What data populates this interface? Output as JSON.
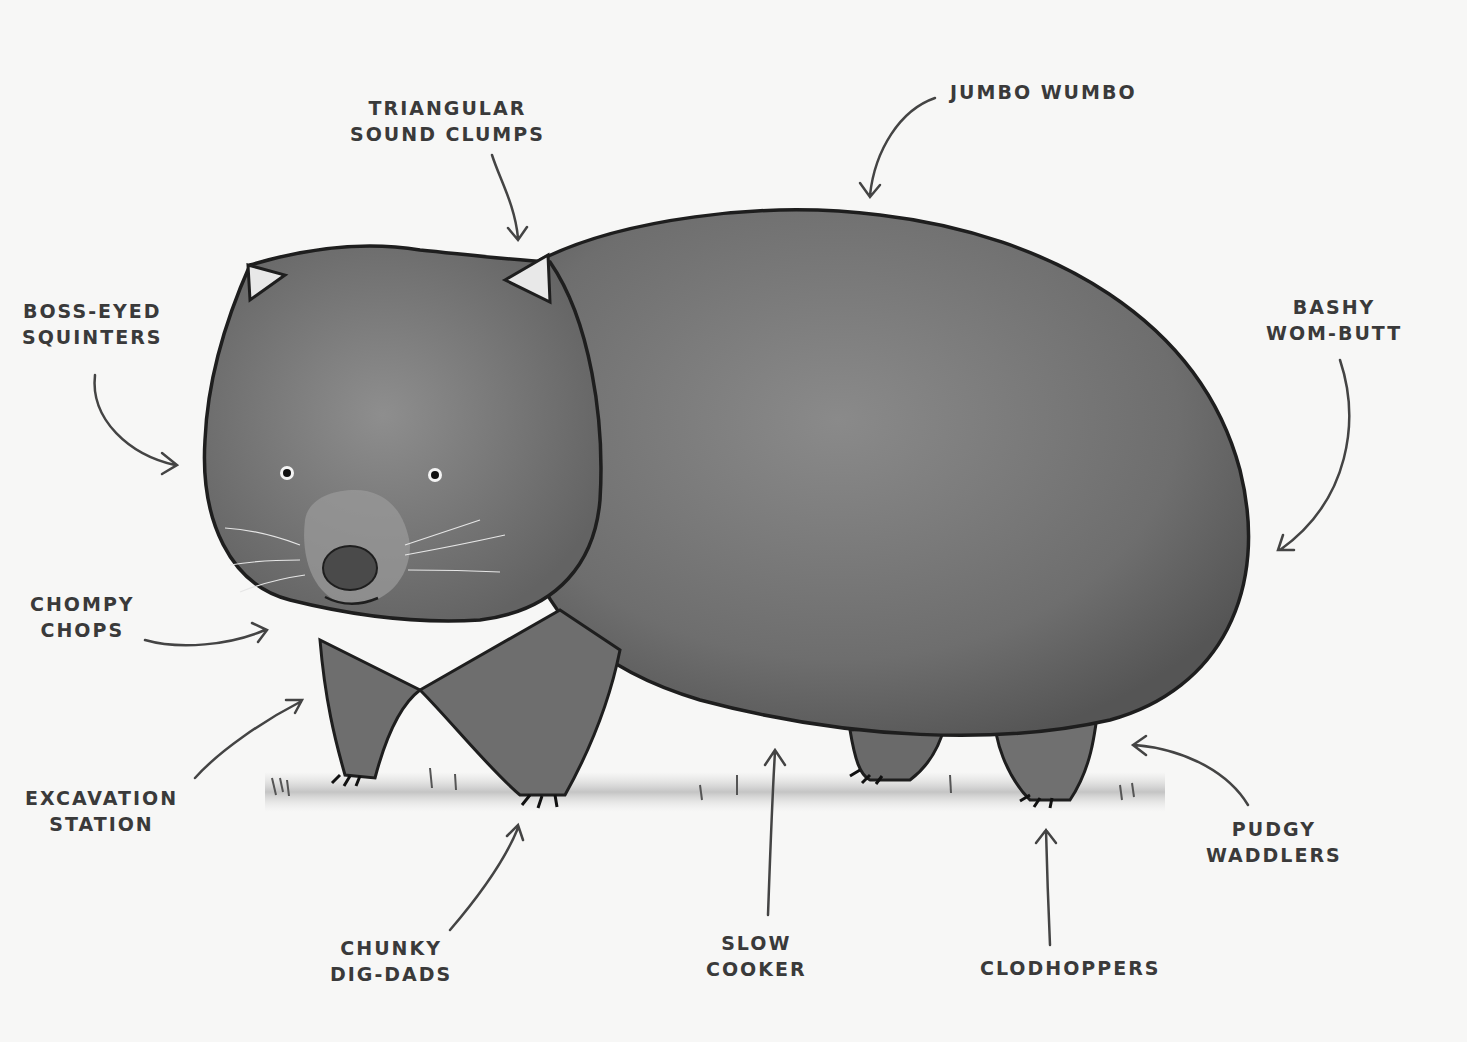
{
  "diagram": {
    "colors": {
      "background": "#f7f7f6",
      "fur": "#7a7a7a",
      "outline": "#1e1e1e",
      "text": "#3a3a3a"
    },
    "labels": [
      {
        "id": "triangular-sound-clumps",
        "lines": [
          "Triangular",
          "Sound Clumps"
        ],
        "points_to": "ear"
      },
      {
        "id": "jumbo-wumbo",
        "lines": [
          "Jumbo Wumbo"
        ],
        "points_to": "back"
      },
      {
        "id": "boss-eyed-squinters",
        "lines": [
          "Boss-eyed",
          "Squinters"
        ],
        "points_to": "eyes"
      },
      {
        "id": "bashy-wom-butt",
        "lines": [
          "Bashy",
          "Wom-Butt"
        ],
        "points_to": "rump"
      },
      {
        "id": "chompy-chops",
        "lines": [
          "Chompy",
          "Chops"
        ],
        "points_to": "mouth"
      },
      {
        "id": "excavation-station",
        "lines": [
          "Excavation",
          "Station"
        ],
        "points_to": "front-leg"
      },
      {
        "id": "chunky-dig-dads",
        "lines": [
          "Chunky",
          "Dig-Dads"
        ],
        "points_to": "front-paw"
      },
      {
        "id": "slow-cooker",
        "lines": [
          "Slow",
          "Cooker"
        ],
        "points_to": "belly"
      },
      {
        "id": "clodhoppers",
        "lines": [
          "Clodhoppers"
        ],
        "points_to": "back-paw"
      },
      {
        "id": "pudgy-waddlers",
        "lines": [
          "Pudgy",
          "Waddlers"
        ],
        "points_to": "back-leg"
      }
    ]
  }
}
